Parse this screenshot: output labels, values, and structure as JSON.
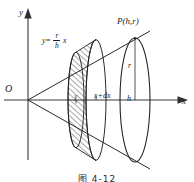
{
  "figure": {
    "caption": "图 4-12"
  },
  "axes": {
    "y_label": "y",
    "x_label": "x",
    "origin_label": "O"
  },
  "labels": {
    "equation": {
      "lhs": "y=",
      "numerator": "r",
      "denominator": "h",
      "variable": "x"
    },
    "point_P": "P(h,r)",
    "base_radius": "r",
    "base_height": "h",
    "slab_right_edge": "x+dx",
    "slab_height": "y"
  },
  "colors": {
    "stroke": "#1d1d1d",
    "hatch": "#2b2b2b",
    "background": "#ffffff",
    "axis": "#3a3a3a"
  },
  "geometry": {
    "origin_px": [
      28,
      100
    ],
    "base_center_px": [
      135,
      100
    ],
    "base_ry_px": 62,
    "base_rx_px": 15,
    "slab_x_px": 76,
    "slab_xdx_px": 96
  }
}
